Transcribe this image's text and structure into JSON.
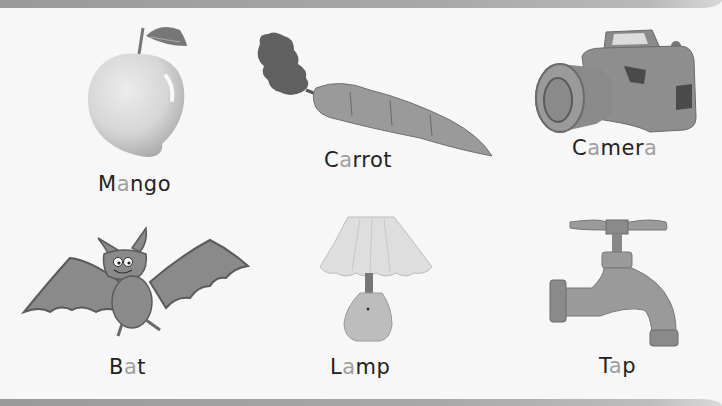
{
  "highlight_color": "#a0a0a0",
  "text_color": "#222222",
  "items": [
    {
      "word": "Mango",
      "parts": [
        "M",
        "a",
        "ngo"
      ],
      "image": "mango-icon"
    },
    {
      "word": "Carrot",
      "parts": [
        "C",
        "a",
        "rrot"
      ],
      "image": "carrot-icon"
    },
    {
      "word": "Camera",
      "parts": [
        "C",
        "a",
        "mer",
        "a"
      ],
      "image": "camera-icon"
    },
    {
      "word": "Bat",
      "parts": [
        "B",
        "a",
        "t"
      ],
      "image": "bat-icon"
    },
    {
      "word": "Lamp",
      "parts": [
        "L",
        "a",
        "mp"
      ],
      "image": "lamp-icon"
    },
    {
      "word": "Tap",
      "parts": [
        "T",
        "a",
        "p"
      ],
      "image": "tap-icon"
    }
  ]
}
